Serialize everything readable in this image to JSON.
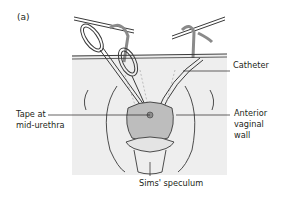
{
  "figure": {
    "panel_label": "(a)",
    "labels": {
      "catheter": "Catheter",
      "tape_line1": "Tape at",
      "tape_line2": "mid-urethra",
      "anterior_line1": "Anterior",
      "anterior_line2": "vaginal",
      "anterior_line3": "wall",
      "sims": "Sims' speculum"
    },
    "colors": {
      "background_panel": "#eeeeee",
      "line": "#3a3a3a",
      "tissue": "#bdbdbd",
      "text": "#231f20"
    }
  }
}
